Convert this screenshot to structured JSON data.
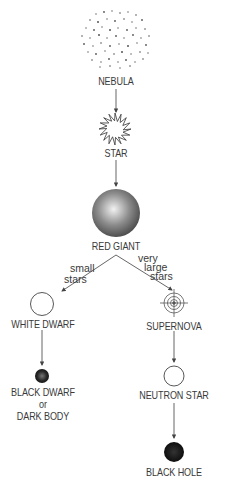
{
  "diagram": {
    "nodes": {
      "nebula": {
        "label": "NEBULA"
      },
      "star": {
        "label": "STAR"
      },
      "red_giant": {
        "label": "RED GIANT"
      },
      "white_dwarf": {
        "label": "WHITE DWARF"
      },
      "black_dwarf": {
        "label_line1": "BLACK DWARF",
        "label_line2": "or",
        "label_line3": "DARK BODY"
      },
      "supernova": {
        "label": "SUPERNOVA"
      },
      "neutron_star": {
        "label": "NEUTRON STAR"
      },
      "black_hole": {
        "label": "BLACK HOLE"
      }
    },
    "branches": {
      "left": {
        "line1": "small",
        "line2": "stars"
      },
      "right": {
        "line1": "very",
        "line2": "large",
        "line3": "stars"
      }
    },
    "edges": [
      {
        "from": "NEBULA",
        "to": "STAR"
      },
      {
        "from": "STAR",
        "to": "RED GIANT"
      },
      {
        "from": "RED GIANT",
        "to": "WHITE DWARF",
        "label": "small stars"
      },
      {
        "from": "RED GIANT",
        "to": "SUPERNOVA",
        "label": "very large stars"
      },
      {
        "from": "WHITE DWARF",
        "to": "BLACK DWARF or DARK BODY"
      },
      {
        "from": "SUPERNOVA",
        "to": "NEUTRON STAR"
      },
      {
        "from": "NEUTRON STAR",
        "to": "BLACK HOLE"
      }
    ],
    "colors": {
      "line": "#555555",
      "text": "#3a3a3a",
      "black_hole": "#111111"
    }
  }
}
